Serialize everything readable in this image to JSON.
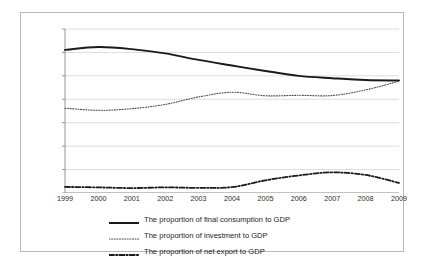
{
  "chart_data": {
    "type": "line",
    "title": "",
    "subtitle": "",
    "xlabel": "",
    "ylabel": "",
    "categories": [
      "1999",
      "2000",
      "2001",
      "2002",
      "2003",
      "2004",
      "2005",
      "2006",
      "2007",
      "2008",
      "2009"
    ],
    "x": [
      1999,
      2000,
      2001,
      2002,
      2003,
      2004,
      2005,
      2006,
      2007,
      2008,
      2009
    ],
    "ylim": [
      0,
      70
    ],
    "ytick_labels": [
      "0.00%",
      "10.00%",
      "20.00%",
      "30.00%",
      "40.00%",
      "50.00%",
      "60.00%",
      "70.00%"
    ],
    "ytick_values": [
      0,
      10,
      20,
      30,
      40,
      50,
      60,
      70
    ],
    "grid": true,
    "legend_position": "bottom",
    "series": [
      {
        "name": "The proportion of final consumption to GDP",
        "style": "solid",
        "color": "#1a1a1a",
        "values": [
          61.1,
          62.3,
          61.4,
          59.6,
          56.8,
          54.4,
          52.1,
          50.0,
          49.0,
          48.2,
          48.0
        ]
      },
      {
        "name": "The proportion of investment to GDP",
        "style": "dotted",
        "color": "#4d4d4d",
        "values": [
          36.2,
          35.3,
          36.0,
          37.8,
          41.0,
          43.0,
          41.5,
          41.7,
          41.6,
          44.0,
          47.7
        ]
      },
      {
        "name": "The proportion of net export to GDP",
        "style": "dashdot",
        "color": "#1a1a1a",
        "values": [
          2.6,
          2.4,
          2.1,
          2.4,
          2.2,
          2.5,
          5.4,
          7.5,
          8.8,
          7.7,
          4.3
        ]
      }
    ]
  },
  "legend": {
    "items": [
      {
        "label": "The proportion of final consumption to GDP",
        "style": "solid"
      },
      {
        "label": "The proportion of investment to GDP",
        "style": "dotted"
      },
      {
        "label": "The proportion of net export to GDP",
        "style": "dashdot"
      }
    ]
  }
}
